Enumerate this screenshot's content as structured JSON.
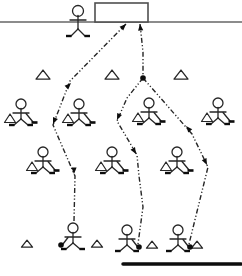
{
  "diagram": {
    "canvas": {
      "width": 242,
      "height": 276
    },
    "colors": {
      "background": "#ffffff",
      "ink": "#262626",
      "solid_fill": "#0d0d0d",
      "goal_stroke": "#4f4f4f",
      "goal_line_gray": "#8c8c8c"
    },
    "goal_line": {
      "x1": 0,
      "x2": 242,
      "y": 22,
      "thickness": 2
    },
    "goal": {
      "x": 95,
      "y": 3,
      "width": 53,
      "height": 19
    },
    "board_line": {
      "x1": 123,
      "x2": 241,
      "y": 264,
      "thickness": 3.5
    },
    "junction_dot": {
      "x": 143,
      "y": 78,
      "r": 2.8
    },
    "figures": {
      "goalkeeper": {
        "x": 78,
        "y": 11
      },
      "row2_players": [
        {
          "x": 21,
          "y": 104
        },
        {
          "x": 79,
          "y": 104
        },
        {
          "x": 149,
          "y": 103
        },
        {
          "x": 218,
          "y": 103
        }
      ],
      "row3_players": [
        {
          "x": 43,
          "y": 152
        },
        {
          "x": 112,
          "y": 152
        },
        {
          "x": 177,
          "y": 152
        }
      ],
      "shooters": [
        {
          "x": 73,
          "y": 228,
          "puck_side": "left"
        },
        {
          "x": 127,
          "y": 230,
          "puck_side": "right"
        },
        {
          "x": 178,
          "y": 230,
          "puck_side": "right"
        }
      ]
    },
    "cones": {
      "upper": [
        {
          "x": 43,
          "y": 75
        },
        {
          "x": 112,
          "y": 75
        },
        {
          "x": 181,
          "y": 75
        }
      ],
      "lower": [
        {
          "x": 27,
          "y": 244
        },
        {
          "x": 97,
          "y": 244
        },
        {
          "x": 152,
          "y": 245
        },
        {
          "x": 197,
          "y": 245
        }
      ]
    },
    "paths": [
      {
        "name": "left-path",
        "points": [
          [
            74,
            221
          ],
          [
            75,
            176
          ],
          [
            53,
            125
          ],
          [
            70,
            81
          ],
          [
            126,
            24
          ]
        ]
      },
      {
        "name": "center-stem",
        "points": [
          [
            140,
            24
          ],
          [
            143,
            52
          ],
          [
            143,
            78
          ]
        ]
      },
      {
        "name": "middle-branch",
        "points": [
          [
            143,
            78
          ],
          [
            127,
            98
          ],
          [
            117,
            121
          ],
          [
            137,
            155
          ],
          [
            139,
            176
          ],
          [
            143,
            207
          ],
          [
            138,
            244
          ]
        ]
      },
      {
        "name": "right-branch",
        "points": [
          [
            143,
            78
          ],
          [
            192,
            134
          ],
          [
            208,
            167
          ],
          [
            189,
            244
          ]
        ]
      }
    ],
    "arrows": [
      {
        "x": 126,
        "y": 24,
        "angle": -45
      },
      {
        "x": 140,
        "y": 24,
        "angle": -96
      },
      {
        "x": 71,
        "y": 83,
        "angle": -45
      },
      {
        "x": 53,
        "y": 124,
        "angle": 112
      },
      {
        "x": 74,
        "y": 174,
        "angle": 90
      },
      {
        "x": 117,
        "y": 120,
        "angle": 113
      },
      {
        "x": 136,
        "y": 154,
        "angle": 60
      },
      {
        "x": 186,
        "y": 126,
        "angle": -131
      },
      {
        "x": 207,
        "y": 165,
        "angle": 64
      }
    ],
    "dash_pattern": "5 2.2 1.2 2.2 1.2 2.2"
  }
}
